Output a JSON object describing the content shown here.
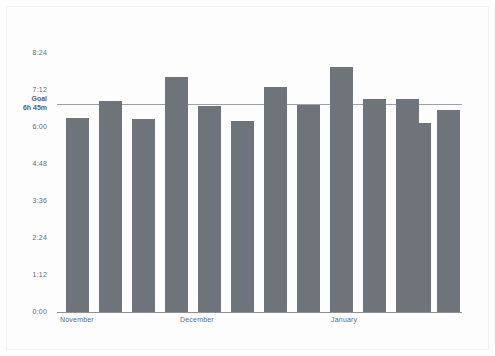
{
  "chart_data": {
    "type": "bar",
    "title": "",
    "subtitle": "",
    "xlabel": "",
    "ylabel": "",
    "categories": [
      "Nov w1",
      "Nov w2",
      "Nov w3",
      "Nov w4",
      "Dec w1",
      "Dec w2",
      "Dec w3",
      "Dec w4",
      "Dec w5",
      "Jan w1",
      "Jan w2",
      "Jan w3",
      "Jan w4"
    ],
    "value_labels": [
      "6:17",
      "6:51",
      "6:15",
      "7:37",
      "6:41",
      "6:11",
      "7:18",
      "6:43",
      "7:57",
      "6:55",
      "6:55",
      "6:07",
      "6:33"
    ],
    "values_minutes": [
      377,
      411,
      375,
      457,
      401,
      371,
      438,
      403,
      477,
      415,
      415,
      367,
      393
    ],
    "ylim_minutes": [
      0,
      504
    ],
    "ytick_labels": [
      "0:00",
      "1:12",
      "2:24",
      "3:36",
      "4:48",
      "6:00",
      "7:12",
      "8:24"
    ],
    "ytick_minutes": [
      0,
      72,
      144,
      216,
      288,
      360,
      432,
      504
    ],
    "xtick_labels": [
      "November",
      "December",
      "January"
    ],
    "xtick_positions": [
      0,
      5,
      9
    ],
    "grid": false,
    "legend": "none",
    "bar_color": "#6e7479",
    "axis_color": "#8c9299",
    "text_color": "#5f6a72",
    "background": "#fdfdfd",
    "reference_line": {
      "label": "Goal",
      "value_label": "6h 45m",
      "value_minutes": 405,
      "color": "#9aa3a9"
    }
  }
}
